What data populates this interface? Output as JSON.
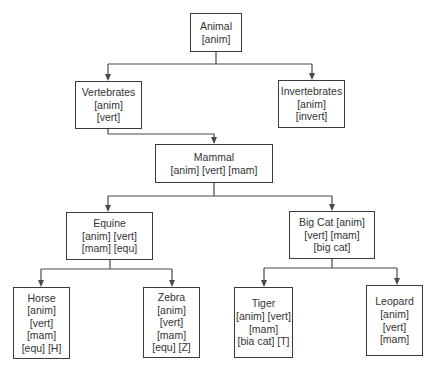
{
  "diagram": {
    "type": "tree",
    "nodes": [
      {
        "id": "animal",
        "lines": [
          "Animal",
          "[anim]"
        ],
        "box": [
          190,
          13,
          52,
          39
        ]
      },
      {
        "id": "vertebrates",
        "lines": [
          "Vertebrates",
          "[anim]",
          "[vert]"
        ],
        "box": [
          75,
          81,
          67,
          48
        ]
      },
      {
        "id": "invertebrates",
        "lines": [
          "Invertebrates",
          "[anim]",
          "[invert]"
        ],
        "box": [
          278,
          80,
          67,
          48
        ]
      },
      {
        "id": "mammal",
        "lines": [
          "Mammal",
          "[anim] [vert] [mam]"
        ],
        "box": [
          155,
          144,
          118,
          39
        ]
      },
      {
        "id": "equine",
        "lines": [
          "Equine",
          "[anim] [vert]",
          "[mam] [equ]"
        ],
        "box": [
          66,
          212,
          87,
          48
        ]
      },
      {
        "id": "big-cat",
        "lines": [
          "Big Cat [anim]",
          "[vert] [mam]",
          "[big cat]"
        ],
        "box": [
          289,
          211,
          86,
          48
        ]
      },
      {
        "id": "horse",
        "lines": [
          "Horse",
          "[anim]",
          "[vert]",
          "[mam]",
          "[equ] [H]"
        ],
        "box": [
          13,
          287,
          57,
          72
        ]
      },
      {
        "id": "zebra",
        "lines": [
          "Zebra",
          "[anim]",
          "[vert]",
          "[mam]",
          "[equ] [Z]"
        ],
        "box": [
          143,
          287,
          57,
          71
        ]
      },
      {
        "id": "tiger",
        "lines": [
          "Tiger",
          "[anim] [vert]",
          "[mam]",
          "[bia cat] [T]"
        ],
        "box": [
          234,
          287,
          59,
          71
        ]
      },
      {
        "id": "leopard",
        "lines": [
          "Leopard",
          "[anim]",
          "[vert]",
          "[mam]"
        ],
        "box": [
          366,
          285,
          57,
          71
        ]
      }
    ],
    "edges": [
      {
        "from": "animal",
        "to": "vertebrates"
      },
      {
        "from": "animal",
        "to": "invertebrates"
      },
      {
        "from": "vertebrates",
        "to": "mammal"
      },
      {
        "from": "mammal",
        "to": "equine"
      },
      {
        "from": "mammal",
        "to": "big-cat"
      },
      {
        "from": "equine",
        "to": "horse"
      },
      {
        "from": "equine",
        "to": "zebra"
      },
      {
        "from": "big-cat",
        "to": "tiger"
      },
      {
        "from": "big-cat",
        "to": "leopard"
      }
    ],
    "connectors": [
      {
        "id": "animal-split",
        "path": "M216 52 L216 64 M108 64 L312 64 M108 64 L108 79 M312 64 L312 78",
        "arrows": [
          [
            108,
            81
          ],
          [
            312,
            80
          ]
        ]
      },
      {
        "id": "vert-to-mammal",
        "path": "M108 129 L108 134 L214 134 L214 142",
        "arrows": [
          [
            214,
            144
          ]
        ]
      },
      {
        "id": "mammal-split",
        "path": "M214 183 L214 196 M108 196 L332 196 M108 196 L108 210 M332 196 L332 209",
        "arrows": [
          [
            108,
            212
          ],
          [
            332,
            211
          ]
        ]
      },
      {
        "id": "equine-split",
        "path": "M110 260 L110 269 M41 269 L172 269 M41 269 L41 285 M172 269 L172 285",
        "arrows": [
          [
            41,
            287
          ],
          [
            172,
            287
          ]
        ]
      },
      {
        "id": "bigcat-split",
        "path": "M332 259 L332 268 M264 268 L397 268 M264 268 L264 285 M397 268 L397 283",
        "arrows": [
          [
            264,
            287
          ],
          [
            397,
            285
          ]
        ]
      }
    ],
    "colors": {
      "line": "#4a4a4a",
      "border": "#3a3a3a",
      "text": "#333333",
      "background": "#ffffff"
    }
  }
}
